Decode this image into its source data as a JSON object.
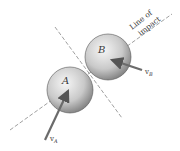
{
  "figure": {
    "ball_a_label": "A",
    "ball_b_label": "B",
    "velocity_a": {
      "symbol": "v",
      "subscript": "A"
    },
    "velocity_b": {
      "symbol": "v",
      "subscript": "B"
    },
    "line_of_impact_line1": "Line of",
    "line_of_impact_line2": "impact"
  },
  "colors": {
    "dash": "#888888",
    "arrow": "#6b6b6b",
    "sphere_light": "#f4f4f4",
    "sphere_dark": "#7a7a7a"
  }
}
